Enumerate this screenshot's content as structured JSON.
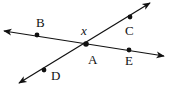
{
  "diagram": {
    "type": "intersecting-lines",
    "colors": {
      "stroke": "#111111",
      "background": "#ffffff"
    },
    "lines": [
      {
        "name": "line-BE",
        "from": [
          4,
          31
        ],
        "to": [
          164,
          56
        ],
        "arrows": "both",
        "points_on_line": [
          "B",
          "A",
          "E"
        ]
      },
      {
        "name": "line-DC",
        "from": [
          19,
          83
        ],
        "to": [
          150,
          3
        ],
        "arrows": "both",
        "points_on_line": [
          "D",
          "A",
          "C"
        ]
      }
    ],
    "points": [
      {
        "id": "B",
        "x": 37,
        "y": 35,
        "label": "B",
        "label_x": 36,
        "label_y": 27
      },
      {
        "id": "A",
        "x": 86,
        "y": 44,
        "label": "A",
        "label_x": 88,
        "label_y": 64
      },
      {
        "id": "C",
        "x": 130,
        "y": 17,
        "label": "C",
        "label_x": 125,
        "label_y": 35
      },
      {
        "id": "E",
        "x": 129,
        "y": 50,
        "label": "E",
        "label_x": 125,
        "label_y": 65
      },
      {
        "id": "D",
        "x": 44,
        "y": 70,
        "label": "D",
        "label_x": 51,
        "label_y": 80
      }
    ],
    "angle_label": {
      "text": "x",
      "x": 81,
      "y": 35
    }
  }
}
